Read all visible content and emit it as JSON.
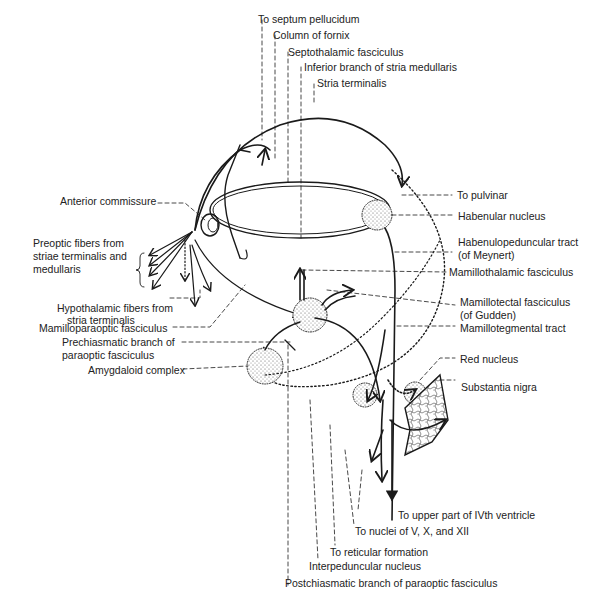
{
  "diagram": {
    "type": "neuroanatomy-pathways",
    "colors": {
      "line": "#1a1a1a",
      "background": "#ffffff",
      "stipple": "#555555"
    }
  },
  "labels": {
    "septum_pellucidum": "To septum pellucidum",
    "column_fornix": "Column of fornix",
    "septothalamic": "Septothalamic fasciculus",
    "inferior_branch": "Inferior branch of stria medullaris",
    "stria_terminalis": "Stria terminalis",
    "to_pulvinar": "To pulvinar",
    "anterior_commissure": "Anterior commissure",
    "habenular_nucleus": "Habenular nucleus",
    "preoptic_1": "Preoptic fibers from",
    "preoptic_2": "striae terminalis and",
    "preoptic_3": "medullaris",
    "habenulopeduncular_1": "Habenulopeduncular tract",
    "habenulopeduncular_2": "(of Meynert)",
    "mamillothalamic": "Mamillothalamic fasciculus",
    "hypothalamic_1": "Hypothalamic fibers from",
    "hypothalamic_2": "stria terminalis",
    "mamillotectal_1": "Mamillotectal fasciculus",
    "mamillotectal_2": "(of Gudden)",
    "mamilloparaoptic": "Mamilloparaoptic fasciculus",
    "mamillotegmental": "Mamillotegmental tract",
    "prechiasmatic_1": "Prechiasmatic branch of",
    "prechiasmatic_2": "paraoptic fasciculus",
    "amygdaloid": "Amygdaloid complex",
    "red_nucleus": "Red nucleus",
    "substantia_nigra": "Substantia nigra",
    "ivth_ventricle": "To upper part of IVth ventricle",
    "nuclei_v_x_xii": "To nuclei of V, X, and XII",
    "reticular": "To reticular formation",
    "interpeduncular": "Interpeduncular nucleus",
    "postchiasmatic": "Postchiasmatic branch of paraoptic fasciculus"
  }
}
